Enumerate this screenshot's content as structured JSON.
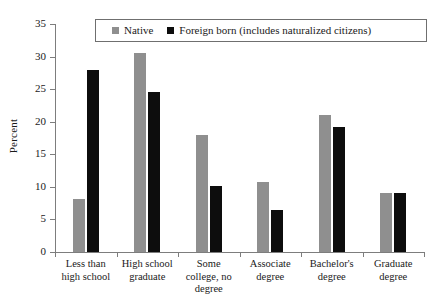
{
  "chart_data": {
    "type": "bar",
    "title": "",
    "xlabel": "",
    "ylabel": "Percent",
    "ylim": [
      0,
      35
    ],
    "yticks": [
      0,
      5,
      10,
      15,
      20,
      25,
      30,
      35
    ],
    "grid": false,
    "legend_position": "top-center",
    "categories": [
      "Less than high school",
      "High school graduate",
      "Some college, no degree",
      "Associate degree",
      "Bachelor's degree",
      "Graduate degree"
    ],
    "category_lines": [
      [
        "Less than",
        "high school"
      ],
      [
        "High school",
        "graduate"
      ],
      [
        "Some",
        "college, no",
        "degree"
      ],
      [
        "Associate",
        "degree"
      ],
      [
        "Bachelor's",
        "degree"
      ],
      [
        "Graduate",
        "degree"
      ]
    ],
    "series": [
      {
        "name": "Native",
        "color": "#8f8f8f",
        "values": [
          8.1,
          30.5,
          18.0,
          10.8,
          21.0,
          9.0
        ]
      },
      {
        "name": "Foreign born (includes naturalized citizens)",
        "color": "#0d0d0d",
        "values": [
          28.0,
          24.6,
          10.1,
          6.4,
          19.2,
          9.0
        ]
      }
    ]
  },
  "legend": {
    "items": [
      {
        "label": "Native",
        "swatch": "native-swatch"
      },
      {
        "label": "Foreign born (includes naturalized citizens)",
        "swatch": "foreign-swatch"
      }
    ]
  },
  "axis": {
    "y_title": "Percent",
    "y_tick_labels": [
      "35",
      "30",
      "25",
      "20",
      "15",
      "10",
      "5",
      "0"
    ]
  },
  "title_remnant": "",
  "colors": {
    "native": "#8f8f8f",
    "foreign": "#0d0d0d",
    "axis": "#7d7d7d",
    "text": "#1a1a1a",
    "background": "#ffffff"
  }
}
